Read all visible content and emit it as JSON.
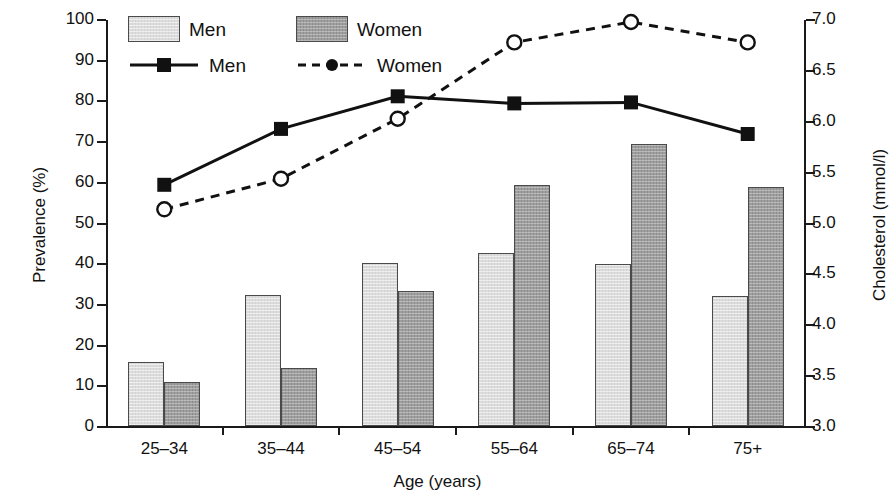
{
  "chart_data": {
    "type": "bar",
    "title": "",
    "xlabel": "Age (years)",
    "ylabel": "Prevalence (%)",
    "ylabel_right": "Cholesterol (mmol/l)",
    "categories": [
      "25–34",
      "35–44",
      "45–54",
      "55–64",
      "65–74",
      "75+"
    ],
    "ylim": [
      0,
      100
    ],
    "yticks": [
      "0",
      "10",
      "20",
      "30",
      "40",
      "50",
      "60",
      "70",
      "80",
      "90",
      "100"
    ],
    "ylim_right": [
      3.0,
      7.0
    ],
    "yticks_right": [
      "3.0",
      "3.5",
      "4.0",
      "4.5",
      "5.0",
      "5.5",
      "6.0",
      "6.5",
      "7.0"
    ],
    "grid": false,
    "legend_position": "top-left",
    "series": [
      {
        "name": "Men",
        "kind": "bar",
        "axis": "left",
        "values": [
          15.8,
          32.2,
          40.1,
          42.5,
          39.8,
          32.0
        ]
      },
      {
        "name": "Women",
        "kind": "bar",
        "axis": "left",
        "values": [
          10.9,
          14.2,
          33.2,
          59.3,
          69.2,
          58.8
        ]
      },
      {
        "name": "Men",
        "kind": "line",
        "axis": "right",
        "values": [
          5.38,
          5.93,
          6.25,
          6.18,
          6.19,
          5.88
        ]
      },
      {
        "name": "Women",
        "kind": "line",
        "axis": "right",
        "values": [
          5.14,
          5.44,
          6.03,
          6.78,
          6.98,
          6.78
        ]
      }
    ]
  },
  "legend": {
    "bars": [
      {
        "label": "Men",
        "swatch": "bar-men-swatch"
      },
      {
        "label": "Women",
        "swatch": "bar-women-swatch"
      }
    ],
    "lines": [
      {
        "label": "Men",
        "style": "solid-square-marker"
      },
      {
        "label": "Women",
        "style": "dashed-open-circle-marker"
      }
    ]
  },
  "colors": {
    "bar_men": "#dcdcdc",
    "bar_women": "#9e9e9e",
    "line": "#111111",
    "axis": "#1a1a1a",
    "background": "#ffffff"
  }
}
